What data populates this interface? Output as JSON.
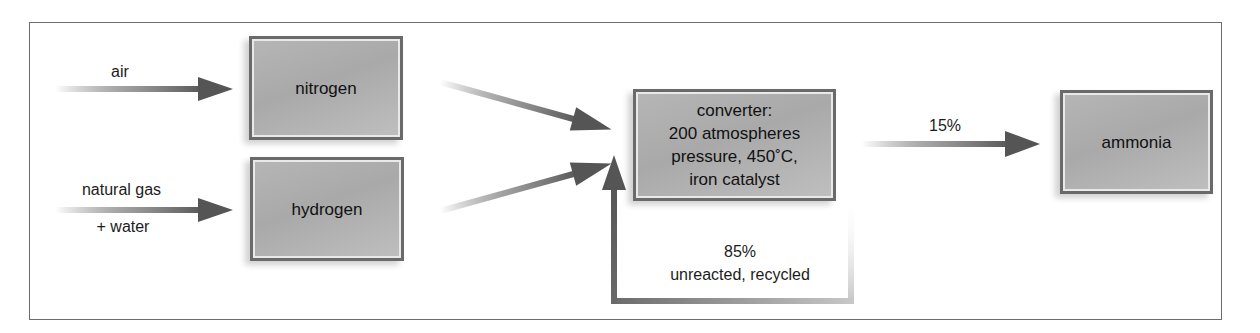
{
  "diagram": {
    "type": "process-flow",
    "inputs": [
      {
        "id": "air",
        "label": "air"
      },
      {
        "id": "natural-gas-water",
        "label_line1": "natural gas",
        "label_line2": "+ water"
      }
    ],
    "nodes": {
      "nitrogen": {
        "label": "nitrogen"
      },
      "hydrogen": {
        "label": "hydrogen"
      },
      "converter": {
        "lines": [
          "converter:",
          "200 atmospheres",
          "pressure, 450˚C,",
          "iron catalyst"
        ]
      },
      "ammonia": {
        "label": "ammonia"
      }
    },
    "flows": {
      "output_label": "15%",
      "recycle_percent": "85%",
      "recycle_label": "unreacted, recycled"
    },
    "colors": {
      "arrow": "#5a5a5a",
      "box_fill": "#b0b0b0",
      "box_border": "#6a6a6a",
      "frame": "#6d6d6d"
    }
  }
}
